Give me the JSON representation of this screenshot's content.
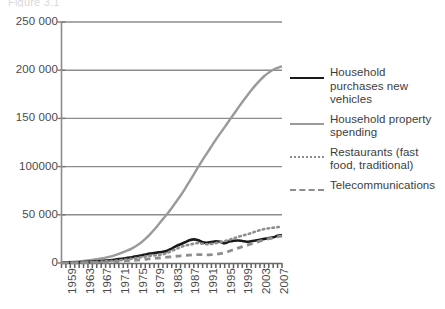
{
  "caption": {
    "cut_off_text": "Figure 3.1"
  },
  "legend": {
    "items": [
      {
        "label": "Household purchases new vehicles",
        "style": "solid-black",
        "color": "#1a1a1a"
      },
      {
        "label": "Household property spending",
        "style": "solid-gray",
        "color": "#9a9a9a"
      },
      {
        "label": "Restaurants (fast food, traditional)",
        "style": "dotted",
        "color": "#8e8e8e"
      },
      {
        "label": "Telecommunications",
        "style": "dashed",
        "color": "#8e8e8e"
      }
    ]
  },
  "axes": {
    "y_ticks": [
      "250 000",
      "200 000",
      "150 000",
      "100000",
      "50 000",
      "0"
    ],
    "x_ticks": [
      "1959",
      "1963",
      "1967",
      "1971",
      "1975",
      "1979",
      "1983",
      "1987",
      "1991",
      "1995",
      "1999",
      "2003",
      "2007"
    ]
  },
  "chart_data": {
    "type": "line",
    "title": "",
    "subtitle": "",
    "xlabel": "",
    "ylabel": "",
    "xlim": [
      1959,
      2009
    ],
    "ylim": [
      0,
      250000
    ],
    "ytick_values": [
      0,
      50000,
      100000,
      150000,
      200000,
      250000
    ],
    "ytick_labels": [
      "0",
      "50 000",
      "100000",
      "150 000",
      "200 000",
      "250 000"
    ],
    "xtick_values": [
      1959,
      1963,
      1967,
      1971,
      1975,
      1979,
      1983,
      1987,
      1991,
      1995,
      1999,
      2003,
      2007
    ],
    "xtick_labels": [
      "1959",
      "1963",
      "1967",
      "1971",
      "1975",
      "1979",
      "1983",
      "1987",
      "1991",
      "1995",
      "1999",
      "2003",
      "2007"
    ],
    "minor_xticks_every": 1,
    "grid": "horizontal",
    "legend_position": "right",
    "x": [
      1959,
      1960,
      1961,
      1962,
      1963,
      1964,
      1965,
      1966,
      1967,
      1968,
      1969,
      1970,
      1971,
      1972,
      1973,
      1974,
      1975,
      1976,
      1977,
      1978,
      1979,
      1980,
      1981,
      1982,
      1983,
      1984,
      1985,
      1986,
      1987,
      1988,
      1989,
      1990,
      1991,
      1992,
      1993,
      1994,
      1995,
      1996,
      1997,
      1998,
      1999,
      2000,
      2001,
      2002,
      2003,
      2004,
      2005,
      2006,
      2007,
      2008,
      2009
    ],
    "series": [
      {
        "name": "Household property spending",
        "style": "solid",
        "color": "#9a9a9a",
        "width": 2.4,
        "values": [
          600,
          800,
          1000,
          1300,
          1700,
          2100,
          2600,
          3200,
          3900,
          4700,
          5600,
          6700,
          8000,
          9500,
          11200,
          13000,
          15200,
          17800,
          21000,
          25000,
          29500,
          34500,
          40000,
          45500,
          51000,
          57000,
          63500,
          70000,
          77000,
          84500,
          92000,
          99500,
          107000,
          114000,
          121000,
          128000,
          134500,
          141000,
          147500,
          154000,
          160500,
          167000,
          173000,
          179000,
          184500,
          189500,
          194000,
          197500,
          200500,
          202500,
          204000
        ]
      },
      {
        "name": "Household purchases new vehicles",
        "style": "solid",
        "color": "#1a1a1a",
        "width": 2.6,
        "values": [
          300,
          400,
          500,
          650,
          800,
          1000,
          1250,
          1500,
          1800,
          2100,
          2500,
          2900,
          3400,
          4000,
          4700,
          5300,
          6000,
          6900,
          7800,
          8800,
          9800,
          10400,
          11000,
          11600,
          12800,
          15000,
          17500,
          19500,
          21500,
          23500,
          24500,
          23500,
          21500,
          21000,
          21800,
          22600,
          22000,
          20500,
          22200,
          23000,
          23400,
          22800,
          22000,
          22600,
          23400,
          24200,
          25000,
          25800,
          26600,
          28200,
          29000
        ]
      },
      {
        "name": "Restaurants (fast food, traditional)",
        "style": "dotted",
        "color": "#8e8e8e",
        "width": 2.6,
        "values": [
          200,
          260,
          330,
          420,
          520,
          640,
          780,
          950,
          1150,
          1380,
          1650,
          1950,
          2300,
          2750,
          3250,
          3800,
          4400,
          5100,
          5900,
          6700,
          7500,
          7900,
          8400,
          9000,
          10500,
          12500,
          14500,
          16500,
          18000,
          19000,
          20000,
          20600,
          20000,
          19400,
          19800,
          20600,
          21600,
          22600,
          24000,
          25600,
          27000,
          28400,
          29600,
          31000,
          32600,
          34000,
          35200,
          36000,
          36600,
          37200,
          37400
        ]
      },
      {
        "name": "Telecommunications",
        "style": "dashed",
        "color": "#8e8e8e",
        "width": 2.8,
        "values": [
          120,
          150,
          190,
          240,
          300,
          370,
          450,
          550,
          660,
          790,
          940,
          1120,
          1320,
          1560,
          1830,
          2150,
          2500,
          2900,
          3350,
          3850,
          4400,
          4800,
          5200,
          5600,
          6000,
          6500,
          7000,
          7500,
          7900,
          8200,
          8500,
          8700,
          8600,
          8400,
          8600,
          9100,
          9800,
          10800,
          12200,
          13800,
          15400,
          17000,
          18400,
          19800,
          21200,
          22600,
          24000,
          25200,
          26200,
          27200,
          28000
        ]
      }
    ]
  }
}
